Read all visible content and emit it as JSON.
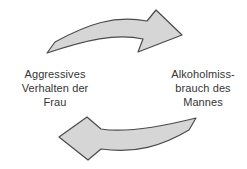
{
  "diagram": {
    "left_node": {
      "lines": [
        "Aggressives",
        "Verhalten der",
        "Frau"
      ]
    },
    "right_node": {
      "lines": [
        "Alkoholmiss-",
        "brauch des",
        "Mannes"
      ]
    },
    "top_arrow": {
      "points_to": "right"
    },
    "bottom_arrow": {
      "points_to": "left"
    }
  },
  "colors": {
    "background": "#ffffff",
    "arrow_fill": "#d6d6d6",
    "arrow_stroke": "#4a4a4a",
    "text": "#353535"
  }
}
